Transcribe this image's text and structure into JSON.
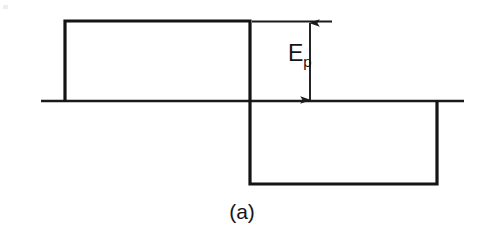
{
  "figure": {
    "caption": "(a)",
    "annotation_label": "E",
    "annotation_subscript": "p",
    "background_color": "#ffffff",
    "line_color": "#1a1a1a",
    "text_color": "#141414"
  },
  "chart_data": {
    "type": "line",
    "title": "",
    "subtitle": "",
    "xlabel": "",
    "ylabel": "",
    "xlim": [
      0,
      482
    ],
    "ylim": [
      0,
      239
    ],
    "grid": false,
    "legend": null,
    "axis": {
      "name": "zero-baseline",
      "y_px": 101,
      "x_start_px": 41,
      "x_end_px": 464
    },
    "series": [
      {
        "name": "square-wave",
        "points": [
          {
            "x": 65,
            "y": 101
          },
          {
            "x": 65,
            "y": 21
          },
          {
            "x": 250,
            "y": 21
          },
          {
            "x": 250,
            "y": 184
          },
          {
            "x": 437,
            "y": 184
          },
          {
            "x": 437,
            "y": 101
          }
        ],
        "levels": {
          "positive_peak_px": 21,
          "zero_px": 101,
          "negative_peak_px": 184
        },
        "amplitude_label": "Ep"
      }
    ],
    "annotations": [
      {
        "kind": "reference-line",
        "name": "peak-reference-line",
        "x_start_px": 252,
        "x_end_px": 332,
        "y_px": 21
      },
      {
        "kind": "dimension-arrow",
        "name": "ep-dimension-arrow",
        "label": "Ep",
        "x_px": 310,
        "y_top_px": 22,
        "y_bottom_px": 101,
        "double_headed": true
      },
      {
        "kind": "text",
        "name": "ep-label",
        "text": "Ep",
        "x_px": 300,
        "y_px": 58
      },
      {
        "kind": "text",
        "name": "figure-caption",
        "text": "(a)",
        "x_px": 243,
        "y_px": 213
      }
    ]
  }
}
